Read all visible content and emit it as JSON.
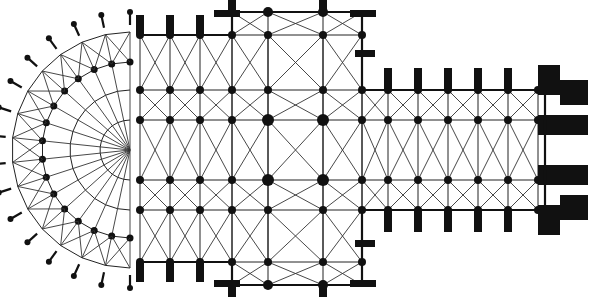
{
  "diagram": {
    "type": "architectural-floor-plan",
    "colors": {
      "ink": "#111111",
      "background": "#ffffff"
    },
    "nave_rows": [
      32,
      90,
      120,
      180,
      210,
      268
    ],
    "center_y": 150,
    "main_cols": [
      140,
      170,
      200,
      232,
      268,
      323,
      362
    ],
    "nave_cols": [
      388,
      418,
      448,
      478,
      508,
      538
    ],
    "transept": {
      "x1": 232,
      "x2": 362,
      "y_top": 12,
      "y_bottom": 285
    },
    "west_front_x": 545,
    "apse_center": [
      130,
      150
    ]
  }
}
